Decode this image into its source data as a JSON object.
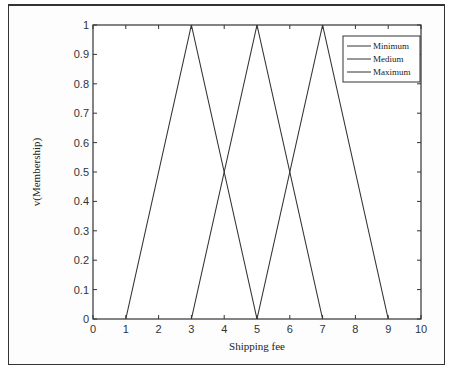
{
  "chart_data": {
    "type": "line",
    "title": "",
    "xlabel": "Shipping fee",
    "ylabel": "v(Membership)",
    "xlim": [
      0,
      10
    ],
    "ylim": [
      0,
      1
    ],
    "xticks": [
      0,
      1,
      2,
      3,
      4,
      5,
      6,
      7,
      8,
      9,
      10
    ],
    "yticks": [
      0,
      0.1,
      0.2,
      0.3,
      0.4,
      0.5,
      0.6,
      0.7,
      0.8,
      0.9,
      1
    ],
    "grid": false,
    "legend_position": "upper right",
    "series": [
      {
        "name": "Minimum",
        "x": [
          1,
          3,
          5
        ],
        "y": [
          0,
          1,
          0
        ]
      },
      {
        "name": "Medium",
        "x": [
          3,
          5,
          7
        ],
        "y": [
          0,
          1,
          0
        ]
      },
      {
        "name": "Maximum",
        "x": [
          5,
          7,
          9
        ],
        "y": [
          0,
          1,
          0
        ]
      }
    ]
  },
  "colors": {
    "line": "#333333",
    "axes": "#333333",
    "background": "#ffffff"
  }
}
